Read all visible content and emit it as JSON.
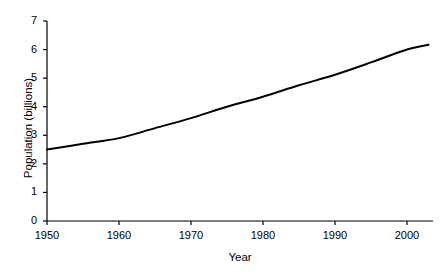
{
  "chart_data": {
    "type": "line",
    "title": "",
    "xlabel": "Year",
    "ylabel": "Population (billions)",
    "xlim": [
      1950,
      2003
    ],
    "ylim": [
      0,
      7
    ],
    "xticks": [
      1950,
      1960,
      1970,
      1980,
      1990,
      2000
    ],
    "yticks": [
      0,
      1,
      2,
      3,
      4,
      5,
      6,
      7
    ],
    "xtick_labels": [
      "1950",
      "1960",
      "1970",
      "1980",
      "1990",
      "2000"
    ],
    "ytick_labels": [
      "0",
      "1",
      "2",
      "3",
      "4",
      "5",
      "6",
      "7"
    ],
    "grid": false,
    "legend": false,
    "line_color": "#000000",
    "line_width": 2,
    "series": [
      {
        "name": "World population",
        "x": [
          1950,
          1955,
          1960,
          1965,
          1970,
          1975,
          1980,
          1985,
          1990,
          1995,
          2000,
          2003
        ],
        "values": [
          2.5,
          2.7,
          2.9,
          3.25,
          3.6,
          4.0,
          4.35,
          4.75,
          5.12,
          5.55,
          6.0,
          6.17
        ]
      }
    ]
  },
  "axes": {
    "x_title": "Year",
    "y_title": "Population (billions)"
  }
}
